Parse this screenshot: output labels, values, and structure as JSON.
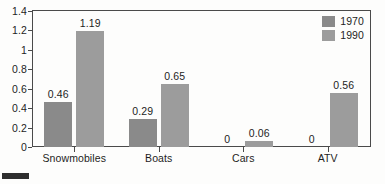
{
  "chart_data": {
    "type": "bar",
    "title": "",
    "subtitle": "",
    "xlabel": "",
    "ylabel": "",
    "categories": [
      "Snowmobiles",
      "Boats",
      "Cars",
      "ATV"
    ],
    "series": [
      {
        "name": "1970",
        "color": "#8a8a8a",
        "values": [
          0.46,
          0.29,
          0,
          0
        ],
        "labels": [
          "0.46",
          "0.29",
          "0",
          "0"
        ]
      },
      {
        "name": "1990",
        "color": "#9c9c9c",
        "values": [
          1.19,
          0.65,
          0.06,
          0.56
        ],
        "labels": [
          "1.19",
          "0.65",
          "0.06",
          "0.56"
        ]
      }
    ],
    "ylim": [
      0,
      1.4
    ],
    "yticks": [
      0,
      0.2,
      0.4,
      0.6,
      0.8,
      1,
      1.2,
      1.4
    ],
    "ytick_labels": [
      "0",
      "0.2",
      "0.4",
      "0.6",
      "0.8",
      "1",
      "1.2",
      "1.4"
    ],
    "grid": false,
    "legend_position": "top-right",
    "frame_color": "#4a4a4a",
    "background_color": "#fdfdfc",
    "text_color": "#1d1d1d"
  }
}
